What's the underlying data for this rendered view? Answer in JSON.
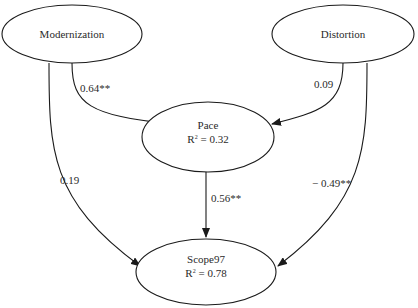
{
  "nodes": {
    "modernization": {
      "label": "Modernization"
    },
    "distortion": {
      "label": "Distortion"
    },
    "pace": {
      "label": "Pace",
      "r2_prefix": "R",
      "r2_sup": "2",
      "r2_value": " = 0.32"
    },
    "scope97": {
      "label": "Scope97",
      "r2_prefix": "R",
      "r2_sup": "2",
      "r2_value": " = 0.78"
    }
  },
  "edges": {
    "modernization_pace": {
      "from": "Modernization",
      "to": "Pace",
      "coef": "0.64**"
    },
    "distortion_pace": {
      "from": "Distortion",
      "to": "Pace",
      "coef": "0.09"
    },
    "pace_scope97": {
      "from": "Pace",
      "to": "Scope97",
      "coef": "0.56**"
    },
    "modernization_scope97": {
      "from": "Modernization",
      "to": "Scope97",
      "coef": "0.19"
    },
    "distortion_scope97": {
      "from": "Distortion",
      "to": "Scope97",
      "coef": "− 0.49**"
    }
  },
  "colors": {
    "stroke": "#1a1a1a",
    "text": "#2a2a2a",
    "background": "#ffffff"
  }
}
